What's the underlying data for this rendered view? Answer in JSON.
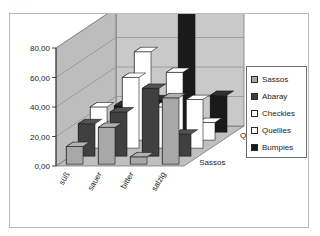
{
  "ghost_text": "· · ·",
  "frame": {
    "border_color": "#b9b9b9",
    "background": "#ffffff"
  },
  "legend": {
    "position": "right",
    "border_color": "#6e6e6e",
    "items": [
      {
        "label": "Sassos",
        "color": "#a8a8a8"
      },
      {
        "label": "Abaray",
        "color": "#404040"
      },
      {
        "label": "Checkies",
        "color": "#ffffff"
      },
      {
        "label": "Quellies",
        "color": "#ffffff"
      },
      {
        "label": "Bumpies",
        "color": "#1a1a1a"
      }
    ]
  },
  "chart_data": {
    "type": "bar",
    "subtype": "3d-clustered-column",
    "title": "",
    "xlabel": "",
    "ylabel": "",
    "zlabel": "",
    "grid": true,
    "ylim": [
      0,
      80
    ],
    "yticks": [
      0,
      20,
      40,
      60,
      80
    ],
    "ytick_labels": [
      "0,00",
      "20,00",
      "40,00",
      "60,00",
      "80,00"
    ],
    "decimal_separator": ",",
    "categories": [
      "süß",
      "sauer",
      "bitter",
      "salzig"
    ],
    "category_rotation": -60,
    "depth_axis": {
      "labels": [
        "Sassos",
        "Quellies"
      ],
      "visible_ticks": [
        "Sassos",
        "Quellies"
      ]
    },
    "series": [
      {
        "name": "Sassos",
        "color": "#a8a8a8",
        "values": [
          12,
          25,
          5,
          45
        ]
      },
      {
        "name": "Abaray",
        "color": "#404040",
        "values": [
          22,
          30,
          46,
          15
        ]
      },
      {
        "name": "Checkies",
        "color": "#ffffff",
        "values": [
          28,
          48,
          28,
          33
        ]
      },
      {
        "name": "Quellies",
        "color": "#ffffff",
        "values": [
          10,
          60,
          46,
          12
        ]
      },
      {
        "name": "Bumpies",
        "color": "#1a1a1a",
        "values": [
          18,
          22,
          84,
          25
        ]
      }
    ]
  },
  "floor": {
    "color": "#bfbfbf"
  },
  "walls": {
    "back_color": "#c9c9c9",
    "side_color": "#bdbdbd"
  }
}
